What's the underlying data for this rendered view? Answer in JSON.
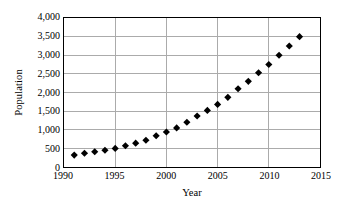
{
  "chart_data": {
    "type": "scatter",
    "title": "",
    "xlabel": "Year",
    "ylabel": "Population",
    "xlim": [
      1990,
      2015
    ],
    "ylim": [
      0,
      4000
    ],
    "xticks": [
      "1990",
      "1995",
      "2000",
      "2005",
      "2010",
      "2015"
    ],
    "xtick_values": [
      1990,
      1995,
      2000,
      2005,
      2010,
      2015
    ],
    "yticks": [
      "0",
      "500",
      "1,000",
      "1,500",
      "2,000",
      "2,500",
      "3,000",
      "3,500",
      "4,000"
    ],
    "ytick_values": [
      0,
      500,
      1000,
      1500,
      2000,
      2500,
      3000,
      3500,
      4000
    ],
    "grid": "horizontal-and-vertical",
    "legend": "none",
    "marker": "filled-diamond",
    "marker_color": "#000000",
    "gridline_color": "#aaaaaa",
    "axis_color": "#000000",
    "x": [
      1991,
      1992,
      1993,
      1994,
      1995,
      1996,
      1997,
      1998,
      1999,
      2000,
      2001,
      2002,
      2003,
      2004,
      2005,
      2006,
      2007,
      2008,
      2009,
      2010,
      2011,
      2012,
      2013
    ],
    "values": [
      320,
      370,
      410,
      450,
      500,
      570,
      640,
      720,
      840,
      940,
      1050,
      1200,
      1370,
      1520,
      1680,
      1870,
      2100,
      2300,
      2530,
      2750,
      3000,
      3250,
      3500
    ],
    "series": [
      {
        "name": "Population",
        "values": [
          320,
          370,
          410,
          450,
          500,
          570,
          640,
          720,
          840,
          940,
          1050,
          1200,
          1370,
          1520,
          1680,
          1870,
          2100,
          2300,
          2530,
          2750,
          3000,
          3250,
          3500
        ]
      }
    ]
  }
}
